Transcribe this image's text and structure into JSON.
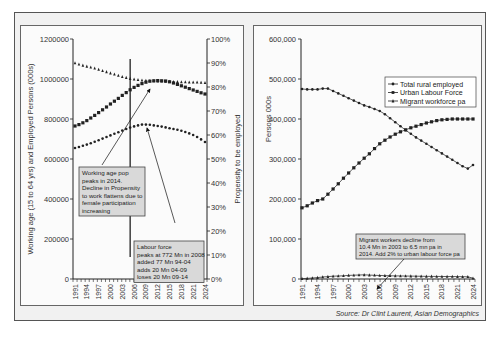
{
  "source": "Source: Dr Clint Laurent, Asian Demographics",
  "chart_data": [
    {
      "type": "line",
      "id": "left",
      "title": "",
      "xlabel": "",
      "ylabel": "Working age (15 to 64 yrs) and Employed Persons (000s)",
      "y2label": "Propensity to be employed",
      "ylim": [
        0,
        1200000
      ],
      "y2lim": [
        0,
        100
      ],
      "yticks": [
        "0",
        "200000",
        "400000",
        "600000",
        "800000",
        "1000000",
        "1200000"
      ],
      "y2ticks": [
        "0%",
        "10%",
        "20%",
        "30%",
        "40%",
        "50%",
        "60%",
        "70%",
        "80%",
        "90%",
        "100%"
      ],
      "xticks": [
        "1991",
        "1994",
        "1997",
        "2000",
        "2003",
        "2006",
        "2009",
        "2012",
        "2015",
        "2018",
        "2021",
        "2024"
      ],
      "x": [
        1991,
        1992,
        1993,
        1994,
        1995,
        1996,
        1997,
        1998,
        1999,
        2000,
        2001,
        2002,
        2003,
        2004,
        2005,
        2006,
        2007,
        2008,
        2009,
        2010,
        2011,
        2012,
        2013,
        2014,
        2015,
        2016,
        2017,
        2018,
        2019,
        2020,
        2021,
        2022,
        2023,
        2024
      ],
      "series": [
        {
          "name": "Propensity to be employed (%)",
          "axis": "right",
          "marker": "triangle",
          "values": [
            90.0,
            89.5,
            89.0,
            88.6,
            88.2,
            87.8,
            87.3,
            86.8,
            86.3,
            85.8,
            85.3,
            84.8,
            84.3,
            83.9,
            83.5,
            83.2,
            83.0,
            82.8,
            82.7,
            82.6,
            82.5,
            82.4,
            82.4,
            82.3,
            82.3,
            82.2,
            82.2,
            82.1,
            82.1,
            82.0,
            82.0,
            82.0,
            81.9,
            81.8
          ]
        },
        {
          "name": "Working age population",
          "axis": "left",
          "marker": "square",
          "values": [
            765000,
            772000,
            781000,
            792000,
            805000,
            818000,
            832000,
            846000,
            860000,
            875000,
            889000,
            903000,
            918000,
            932000,
            946000,
            958000,
            968000,
            977000,
            984000,
            989000,
            991000,
            992000,
            991000,
            990000,
            986000,
            980000,
            973000,
            966000,
            959000,
            952000,
            945000,
            938000,
            931000,
            925000
          ]
        },
        {
          "name": "Labour force (employed)",
          "axis": "left",
          "marker": "circle",
          "values": [
            655000,
            660000,
            666000,
            672000,
            679000,
            686000,
            694000,
            702000,
            710000,
            718000,
            726000,
            734000,
            742000,
            750000,
            757000,
            763000,
            768000,
            772000,
            772000,
            771000,
            768000,
            765000,
            762000,
            758000,
            754000,
            750000,
            746000,
            741000,
            735000,
            728000,
            720000,
            710000,
            698000,
            685000
          ]
        }
      ],
      "annotations": [
        {
          "text_lines": [
            "Working age pop",
            "peaks in 2014.",
            "Decline in Propensity",
            "to work flattens due to",
            "female participation",
            "increasing"
          ]
        },
        {
          "text_lines": [
            "Labour force",
            "peaks at 772 Mn in 2008",
            "added 77 Mn 94-04",
            "adds 20 Mn 04-09",
            "loses 20 Mn 09-14"
          ]
        }
      ],
      "vertical_marker_year": 2005
    },
    {
      "type": "line",
      "id": "right",
      "title": "",
      "xlabel": "",
      "ylabel": "Persons 000s",
      "ylim": [
        0,
        600000
      ],
      "yticks": [
        "0",
        "100,000",
        "200,000",
        "300,000",
        "400,000",
        "500,000",
        "600,000"
      ],
      "xticks": [
        "1991",
        "1994",
        "1997",
        "2000",
        "2003",
        "2006",
        "2009",
        "2012",
        "2015",
        "2018",
        "2021",
        "2024"
      ],
      "legend_position": "upper right",
      "x": [
        1991,
        1992,
        1993,
        1994,
        1995,
        1996,
        1997,
        1998,
        1999,
        2000,
        2001,
        2002,
        2003,
        2004,
        2005,
        2006,
        2007,
        2008,
        2009,
        2010,
        2011,
        2012,
        2013,
        2014,
        2015,
        2016,
        2017,
        2018,
        2019,
        2020,
        2021,
        2022,
        2023,
        2024
      ],
      "series": [
        {
          "name": "Total rural employed",
          "marker": "circle",
          "values": [
            475000,
            474000,
            474000,
            474000,
            476000,
            476000,
            470000,
            464000,
            458000,
            452000,
            446000,
            440000,
            434000,
            430000,
            425000,
            420000,
            412000,
            402000,
            392000,
            382000,
            372000,
            363000,
            354000,
            346000,
            338000,
            330000,
            322000,
            314000,
            306000,
            298000,
            290000,
            282000,
            276000,
            285000
          ]
        },
        {
          "name": "Urban Labour Force",
          "marker": "square",
          "values": [
            178000,
            183000,
            190000,
            196000,
            200000,
            212000,
            225000,
            238000,
            252000,
            265000,
            278000,
            290000,
            302000,
            313000,
            326000,
            338000,
            347000,
            355000,
            362000,
            368000,
            373000,
            378000,
            382000,
            386000,
            390000,
            393000,
            396000,
            398000,
            399000,
            400000,
            400000,
            400000,
            400000,
            400000
          ]
        },
        {
          "name": "Migrant workforce pa",
          "marker": "triangle",
          "values": [
            1000,
            1500,
            2500,
            3500,
            5000,
            6000,
            7000,
            7500,
            8000,
            9000,
            9500,
            10000,
            10400,
            9800,
            9200,
            8800,
            8400,
            8000,
            7800,
            7600,
            7400,
            7200,
            7000,
            6800,
            6600,
            6500,
            6400,
            6300,
            6200,
            6100,
            6000,
            5800,
            5500,
            2000
          ]
        }
      ],
      "annotations": [
        {
          "text_lines": [
            "Migrant workers decline from",
            "10.4 Mn in 2003 to 6.5 mn pa in",
            "2014. Add 2% to urban labour force pa"
          ]
        }
      ]
    }
  ]
}
